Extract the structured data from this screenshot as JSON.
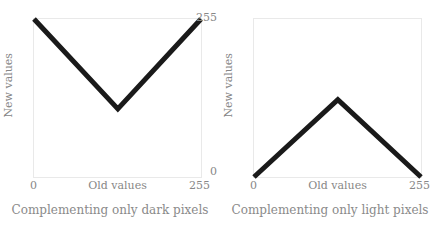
{
  "figure": {
    "background": "#ffffff",
    "line_color": "#1a1a1a",
    "frame_color": "#e9e9e9",
    "text_color": "#878787"
  },
  "panels": [
    {
      "caption": "Complementing only dark pixels",
      "xlabel": "Old values",
      "ylabel": "New values",
      "xticks": [
        "0",
        "255"
      ],
      "yticks": [
        "0",
        "255"
      ]
    },
    {
      "caption": "Complementing only light pixels",
      "xlabel": "Old values",
      "ylabel": "New values",
      "xticks": [
        "0",
        "255"
      ],
      "yticks": [
        "0",
        "255"
      ]
    }
  ],
  "chart_data": [
    {
      "type": "line",
      "title": "Complementing only dark pixels",
      "xlabel": "Old values",
      "ylabel": "New values",
      "xlim": [
        0,
        255
      ],
      "ylim": [
        0,
        255
      ],
      "xticks": [
        0,
        255
      ],
      "yticks": [
        0,
        255
      ],
      "grid": false,
      "legend": "none",
      "series": [
        {
          "name": "dark-pixel complement mapping",
          "x": [
            0,
            128,
            255
          ],
          "y": [
            255,
            110,
            255
          ]
        }
      ]
    },
    {
      "type": "line",
      "title": "Complementing only light pixels",
      "xlabel": "Old values",
      "ylabel": "New values",
      "xlim": [
        0,
        255
      ],
      "ylim": [
        0,
        255
      ],
      "xticks": [
        0,
        255
      ],
      "yticks": [
        0,
        255
      ],
      "grid": false,
      "legend": "none",
      "series": [
        {
          "name": "light-pixel complement mapping",
          "x": [
            0,
            128,
            255
          ],
          "y": [
            0,
            125,
            0
          ]
        }
      ]
    }
  ]
}
